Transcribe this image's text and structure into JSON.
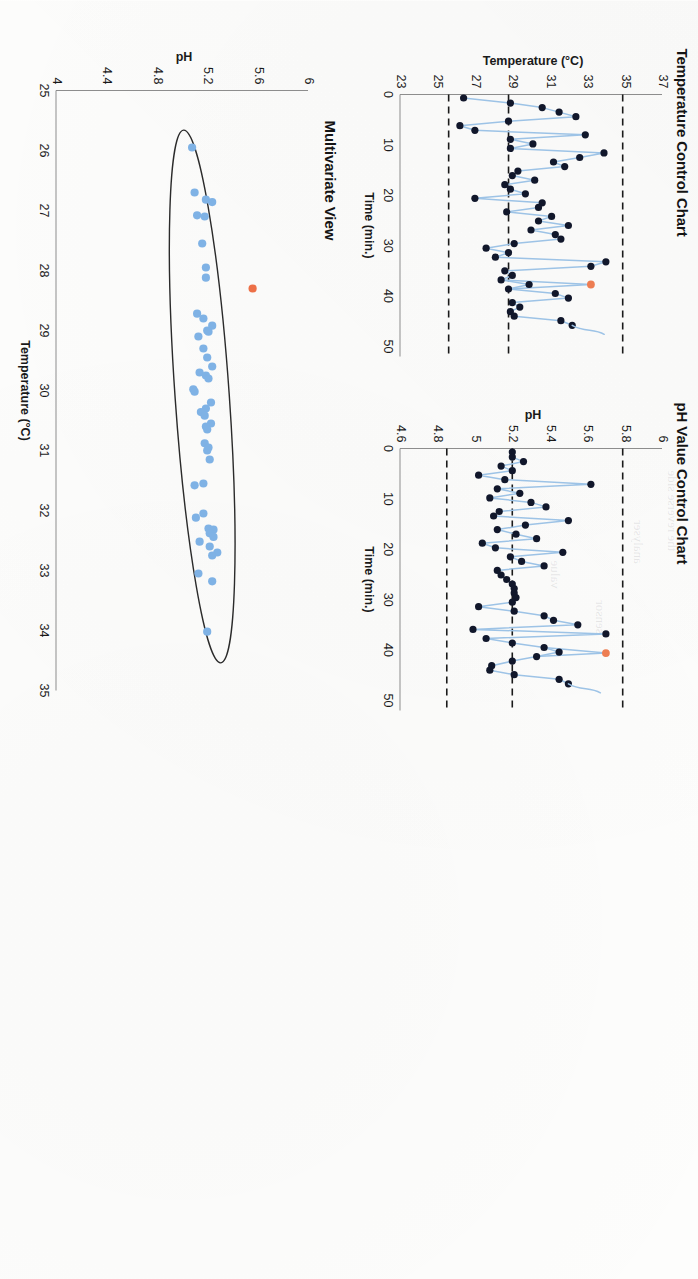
{
  "page": {
    "orientation_degrees": 90,
    "background": "#fdfdfc"
  },
  "panels": {
    "temperature": {
      "title": "Temperature Control Chart"
    },
    "ph": {
      "title": "pH Value Control Chart"
    },
    "multivariate": {
      "title": "Multivariate View"
    }
  },
  "chart_data": [
    {
      "id": "temperature-control-chart",
      "type": "line",
      "title": "Temperature Control Chart",
      "xlabel": "Time (min.)",
      "ylabel": "Temperature (°C)",
      "xlim": [
        0,
        52
      ],
      "ylim": [
        23,
        37
      ],
      "xticks": [
        "0",
        "10",
        "20",
        "30",
        "40",
        "50"
      ],
      "xtick_values": [
        0,
        10,
        20,
        30,
        40,
        50
      ],
      "yticks": [
        "23",
        "25",
        "27",
        "29",
        "31",
        "33",
        "35",
        "37"
      ],
      "ytick_values": [
        23,
        25,
        27,
        29,
        31,
        33,
        35,
        37
      ],
      "grid": false,
      "legend": "none",
      "control_limits": {
        "ucl": 34.9,
        "center": 28.8,
        "lcl": 25.6,
        "style": "dashed",
        "color": "#1a1a1a"
      },
      "marker_color": "#11172b",
      "line_color": "#9dc3e6",
      "outlier_color": "#ed7d52",
      "x": [
        0.7,
        1.7,
        2.6,
        3.5,
        4.4,
        5.3,
        6.2,
        7.1,
        8.0,
        8.9,
        9.8,
        10.7,
        11.6,
        12.5,
        13.4,
        14.3,
        15.2,
        16.1,
        17.0,
        17.9,
        18.8,
        19.7,
        20.6,
        21.5,
        22.4,
        23.3,
        24.2,
        25.1,
        26.0,
        26.9,
        27.8,
        28.7,
        29.6,
        30.5,
        31.4,
        32.3,
        33.2,
        34.1,
        35.0,
        35.9,
        36.8,
        37.7,
        38.6,
        39.5,
        40.4,
        41.3,
        42.2,
        43.1,
        44.0,
        44.9,
        45.8,
        46.7,
        47.6,
        48.5,
        49.4,
        50.3
      ],
      "values": [
        26.4,
        28.9,
        30.6,
        31.5,
        32.4,
        28.8,
        26.2,
        27.0,
        32.9,
        28.9,
        30.1,
        28.9,
        33.9,
        32.6,
        31.2,
        31.8,
        29.3,
        29.0,
        30.2,
        28.6,
        28.9,
        29.7,
        27.0,
        30.6,
        30.4,
        28.7,
        31.1,
        30.4,
        32.0,
        30.0,
        31.3,
        31.6,
        29.1,
        27.6,
        28.8,
        28.1,
        34.0,
        33.2,
        28.6,
        29.0,
        28.4,
        29.9,
        28.8,
        31.3,
        32.0,
        29.0,
        29.4,
        28.9,
        29.1,
        31.6,
        32.2
      ],
      "outliers": [
        {
          "x": 37.7,
          "y": 33.2,
          "label": "out-of-control point"
        }
      ],
      "annotations": []
    },
    {
      "id": "ph-value-control-chart",
      "type": "line",
      "title": "pH Value Control Chart",
      "xlabel": "Time (min.)",
      "ylabel": "pH",
      "xlim": [
        0,
        52
      ],
      "ylim": [
        4.6,
        6.0
      ],
      "xticks": [
        "0",
        "10",
        "20",
        "30",
        "40",
        "50"
      ],
      "xtick_values": [
        0,
        10,
        20,
        30,
        40,
        50
      ],
      "yticks": [
        "4.6",
        "4.8",
        "5",
        "5.2",
        "5.4",
        "5.6",
        "5.8",
        "6"
      ],
      "ytick_values": [
        4.6,
        4.8,
        5.0,
        5.2,
        5.4,
        5.6,
        5.8,
        6.0
      ],
      "grid": false,
      "legend": "none",
      "control_limits": {
        "ucl": 5.79,
        "center": 5.2,
        "lcl": 4.85,
        "style": "dashed",
        "color": "#1a1a1a"
      },
      "marker_color": "#11172b",
      "line_color": "#9dc3e6",
      "outlier_color": "#ed7d52",
      "x": [
        0.7,
        1.7,
        2.6,
        3.5,
        4.4,
        5.3,
        6.2,
        7.1,
        8.0,
        8.9,
        9.8,
        10.7,
        11.6,
        12.5,
        13.4,
        14.3,
        15.2,
        16.1,
        17.0,
        17.9,
        18.8,
        19.7,
        20.6,
        21.5,
        22.4,
        23.3,
        24.2,
        25.1,
        26.0,
        26.9,
        27.8,
        28.7,
        29.6,
        30.5,
        31.4,
        32.3,
        33.2,
        34.1,
        35.0,
        35.9,
        36.8,
        37.7,
        38.6,
        39.5,
        40.4,
        41.3,
        42.2,
        43.1,
        44.0,
        44.9,
        45.8,
        46.7,
        47.6,
        48.5,
        49.4,
        50.3
      ],
      "values": [
        5.2,
        5.2,
        5.26,
        5.14,
        5.2,
        5.02,
        5.16,
        5.62,
        5.12,
        5.24,
        5.08,
        5.3,
        5.38,
        5.13,
        5.1,
        5.5,
        5.27,
        5.12,
        5.22,
        5.33,
        5.04,
        5.11,
        5.47,
        5.19,
        5.25,
        5.37,
        5.12,
        5.14,
        5.17,
        5.2,
        5.21,
        5.21,
        5.22,
        5.2,
        5.02,
        5.21,
        5.37,
        5.42,
        5.55,
        4.99,
        5.7,
        5.06,
        5.2,
        5.37,
        5.45,
        5.33,
        5.2,
        5.09,
        5.08,
        5.21,
        5.45,
        5.5
      ],
      "outliers": [
        {
          "x": 40.6,
          "y": 5.7,
          "label": "out-of-control point"
        }
      ],
      "annotations": []
    },
    {
      "id": "multivariate-view",
      "type": "scatter",
      "title": "Multivariate View",
      "xlabel": "Temperature (°C)",
      "ylabel": "pH",
      "xlim": [
        25,
        35
      ],
      "ylim": [
        4.0,
        6.0
      ],
      "xticks": [
        "25",
        "26",
        "27",
        "28",
        "29",
        "30",
        "31",
        "32",
        "33",
        "34",
        "35"
      ],
      "xtick_values": [
        25,
        26,
        27,
        28,
        29,
        30,
        31,
        32,
        33,
        34,
        35
      ],
      "yticks": [
        "4",
        "4.4",
        "4.8",
        "5.2",
        "5.6",
        "6"
      ],
      "ytick_values": [
        4.0,
        4.4,
        4.8,
        5.2,
        5.6,
        6.0
      ],
      "grid": false,
      "legend": "none",
      "marker_color": "#7fb2e5",
      "outlier_color": "#ed7047",
      "confidence_ellipse": {
        "center_x": 30.1,
        "center_y": 5.16,
        "semi_major": 4.45,
        "semi_minor": 0.215,
        "rotation_degrees": 4.0,
        "stroke": "#2b2b2b"
      },
      "points": [
        {
          "x": 25.95,
          "y": 5.08
        },
        {
          "x": 26.7,
          "y": 5.1
        },
        {
          "x": 26.82,
          "y": 5.19
        },
        {
          "x": 26.86,
          "y": 5.24
        },
        {
          "x": 27.08,
          "y": 5.12
        },
        {
          "x": 27.1,
          "y": 5.18
        },
        {
          "x": 27.55,
          "y": 5.16
        },
        {
          "x": 27.95,
          "y": 5.19
        },
        {
          "x": 28.12,
          "y": 5.19
        },
        {
          "x": 28.72,
          "y": 5.12
        },
        {
          "x": 28.8,
          "y": 5.17
        },
        {
          "x": 28.92,
          "y": 5.24
        },
        {
          "x": 29.0,
          "y": 5.2
        },
        {
          "x": 29.02,
          "y": 5.21
        },
        {
          "x": 29.1,
          "y": 5.13
        },
        {
          "x": 29.3,
          "y": 5.17
        },
        {
          "x": 29.45,
          "y": 5.2
        },
        {
          "x": 29.6,
          "y": 5.24
        },
        {
          "x": 29.7,
          "y": 5.14
        },
        {
          "x": 29.75,
          "y": 5.19
        },
        {
          "x": 29.8,
          "y": 5.21
        },
        {
          "x": 29.98,
          "y": 5.09
        },
        {
          "x": 30.02,
          "y": 5.1
        },
        {
          "x": 30.2,
          "y": 5.23
        },
        {
          "x": 30.3,
          "y": 5.19
        },
        {
          "x": 30.36,
          "y": 5.15
        },
        {
          "x": 30.42,
          "y": 5.18
        },
        {
          "x": 30.55,
          "y": 5.23
        },
        {
          "x": 30.6,
          "y": 5.19
        },
        {
          "x": 30.65,
          "y": 5.2
        },
        {
          "x": 30.88,
          "y": 5.18
        },
        {
          "x": 30.95,
          "y": 5.21
        },
        {
          "x": 31.0,
          "y": 5.2
        },
        {
          "x": 31.15,
          "y": 5.22
        },
        {
          "x": 31.55,
          "y": 5.17
        },
        {
          "x": 31.58,
          "y": 5.1
        },
        {
          "x": 32.05,
          "y": 5.17
        },
        {
          "x": 32.12,
          "y": 5.11
        },
        {
          "x": 32.3,
          "y": 5.21
        },
        {
          "x": 32.32,
          "y": 5.25
        },
        {
          "x": 32.38,
          "y": 5.22
        },
        {
          "x": 32.44,
          "y": 5.25
        },
        {
          "x": 32.52,
          "y": 5.14
        },
        {
          "x": 32.6,
          "y": 5.22
        },
        {
          "x": 32.7,
          "y": 5.28
        },
        {
          "x": 32.75,
          "y": 5.24
        },
        {
          "x": 33.05,
          "y": 5.13
        },
        {
          "x": 33.18,
          "y": 5.24
        },
        {
          "x": 34.02,
          "y": 5.2
        }
      ],
      "outliers": [
        {
          "x": 28.3,
          "y": 5.56,
          "label": "out-of-control point"
        }
      ],
      "annotations": []
    }
  ]
}
